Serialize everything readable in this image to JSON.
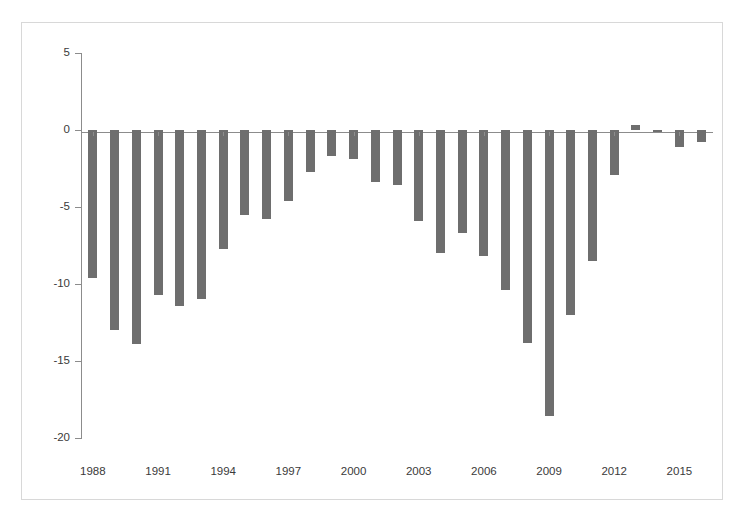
{
  "chart_data": {
    "type": "bar",
    "title": "",
    "subtitle": "",
    "xlabel": "",
    "ylabel": "",
    "categories": [
      "1988",
      "1989",
      "1990",
      "1991",
      "1992",
      "1993",
      "1994",
      "1995",
      "1996",
      "1997",
      "1998",
      "1999",
      "2000",
      "2001",
      "2002",
      "2003",
      "2004",
      "2005",
      "2006",
      "2007",
      "2008",
      "2009",
      "2010",
      "2011",
      "2012",
      "2013",
      "2014",
      "2015",
      "2016"
    ],
    "values": [
      -9.6,
      -13.0,
      -13.9,
      -10.7,
      -11.4,
      -11.0,
      -7.7,
      -5.5,
      -5.8,
      -4.6,
      -2.7,
      -1.7,
      -1.9,
      -3.4,
      -3.6,
      -5.9,
      -8.0,
      -6.7,
      -8.2,
      -10.4,
      -13.8,
      -18.6,
      -12.0,
      -8.5,
      -2.9,
      0.3,
      -0.1,
      -1.1,
      -0.8
    ],
    "ylim": [
      -20,
      5
    ],
    "ytick_labels": [
      "5",
      "0",
      "-5",
      "-10",
      "-15",
      "-20"
    ],
    "ytick_values": [
      5,
      0,
      -5,
      -10,
      -15,
      -20
    ],
    "xtick_labels": [
      "1988",
      "1991",
      "1994",
      "1997",
      "2000",
      "2003",
      "2006",
      "2009",
      "2012",
      "2015"
    ],
    "xtick_values": [
      "1988",
      "1991",
      "1994",
      "1997",
      "2000",
      "2003",
      "2006",
      "2009",
      "2012",
      "2015"
    ],
    "grid": false,
    "legend": null,
    "legend_position": "none",
    "bar_color": "#6e6e6e",
    "axis_color": "#8c8c8c",
    "text_color": "#3a3a3a",
    "background_color": "#ffffff",
    "frame_color": "#d8d8d8"
  }
}
